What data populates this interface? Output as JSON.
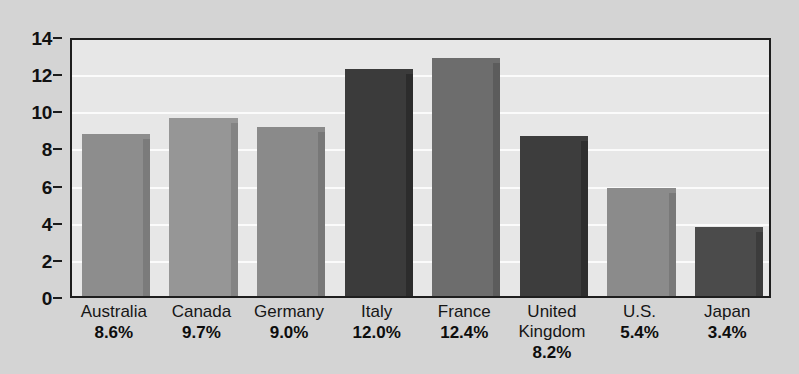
{
  "chart_data": {
    "type": "bar",
    "title": "",
    "subtitle": "",
    "xlabel": "",
    "ylabel": "",
    "ylim": [
      0,
      14
    ],
    "yticks": [
      0,
      2,
      4,
      6,
      8,
      10,
      12,
      14
    ],
    "ytick_labels": [
      "0",
      "2",
      "4",
      "6",
      "8",
      "10",
      "12",
      "14"
    ],
    "grid": true,
    "legend": false,
    "legend_position": "none",
    "categories": [
      "Australia",
      "Canada",
      "Germany",
      "Italy",
      "France",
      "United Kingdom",
      "U.S.",
      "Japan"
    ],
    "values": [
      8.7,
      9.6,
      9.1,
      12.2,
      12.8,
      8.6,
      5.8,
      3.7
    ],
    "data_labels": [
      "8.6%",
      "9.7%",
      "9.0%",
      "12.0%",
      "12.4%",
      "8.2%",
      "5.4%",
      "3.4%"
    ],
    "bar_colors": [
      "#8d8d8d",
      "#969696",
      "#8a8a8a",
      "#3b3b3b",
      "#6d6d6d",
      "#3d3d3d",
      "#8b8b8b",
      "#4b4b4b"
    ],
    "bar_shadow_colors": [
      "#7b7b7b",
      "#848484",
      "#787878",
      "#2c2c2c",
      "#5c5c5c",
      "#2e2e2e",
      "#797979",
      "#3c3c3c"
    ]
  },
  "bars": [
    {
      "name": "Australia",
      "value": 8.7,
      "percent": "8.6%",
      "color": "#8d8d8d",
      "shadow": "#7b7b7b"
    },
    {
      "name": "Canada",
      "value": 9.6,
      "percent": "9.7%",
      "color": "#969696",
      "shadow": "#848484"
    },
    {
      "name": "Germany",
      "value": 9.1,
      "percent": "9.0%",
      "color": "#8a8a8a",
      "shadow": "#787878"
    },
    {
      "name": "Italy",
      "value": 12.2,
      "percent": "12.0%",
      "color": "#3b3b3b",
      "shadow": "#2c2c2c"
    },
    {
      "name": "France",
      "value": 12.8,
      "percent": "12.4%",
      "color": "#6d6d6d",
      "shadow": "#5c5c5c"
    },
    {
      "name": "United\nKingdom",
      "value": 8.6,
      "percent": "8.2%",
      "color": "#3d3d3d",
      "shadow": "#2e2e2e"
    },
    {
      "name": "U.S.",
      "value": 5.8,
      "percent": "5.4%",
      "color": "#8b8b8b",
      "shadow": "#797979"
    },
    {
      "name": "Japan",
      "value": 3.7,
      "percent": "3.4%",
      "color": "#4b4b4b",
      "shadow": "#3c3c3c"
    }
  ],
  "colors": {
    "page_background": "#d4d4d4",
    "plot_background": "#e7e7e7",
    "gridline": "#fbfbfb",
    "axis": "#1e1e1e",
    "text": "#111111"
  }
}
